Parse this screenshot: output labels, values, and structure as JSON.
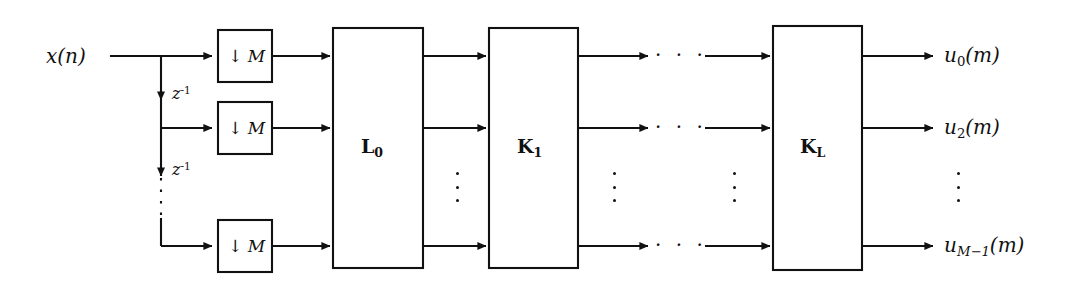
{
  "diagram": {
    "stroke_color": "#111111",
    "background_color": "#ffffff",
    "input": {
      "label": "x(n)",
      "base": "x",
      "arg": "(n)"
    },
    "delays": [
      {
        "label": "z^-1",
        "base": "z",
        "exponent": "-1"
      },
      {
        "label": "z^-1",
        "base": "z",
        "exponent": "-1"
      }
    ],
    "downsamplers": [
      {
        "label": "↓ M",
        "arrow": "↓",
        "factor": "M"
      },
      {
        "label": "↓ M",
        "arrow": "↓",
        "factor": "M"
      },
      {
        "label": "↓ M",
        "arrow": "↓",
        "factor": "M"
      }
    ],
    "blocks": [
      {
        "name": "L0",
        "base": "L",
        "subscript": "0"
      },
      {
        "name": "K1",
        "base": "K",
        "subscript": "1"
      },
      {
        "name": "KL",
        "base": "K",
        "subscript": "L"
      }
    ],
    "outputs": [
      {
        "label": "u_0(m)",
        "base": "u",
        "subscript": "0",
        "arg": "(m)"
      },
      {
        "label": "u_2(m)",
        "base": "u",
        "subscript": "2",
        "arg": "(m)"
      },
      {
        "label": "u_M-1(m)",
        "base": "u",
        "subscript": "M−1",
        "arg": "(m)"
      }
    ],
    "ellipses": {
      "horizontal": "· · ·",
      "vertical": "⋮",
      "horizontal_count": 3,
      "vertical_count": 3
    }
  }
}
